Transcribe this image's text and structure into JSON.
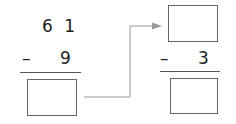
{
  "left_problem": {
    "minuend": "6 1",
    "operator": "–",
    "subtrahend": "9",
    "answer": ""
  },
  "right_problem": {
    "minuend": "",
    "operator": "–",
    "subtrahend": "3",
    "answer": ""
  },
  "arrow": {
    "color": "#888888"
  }
}
